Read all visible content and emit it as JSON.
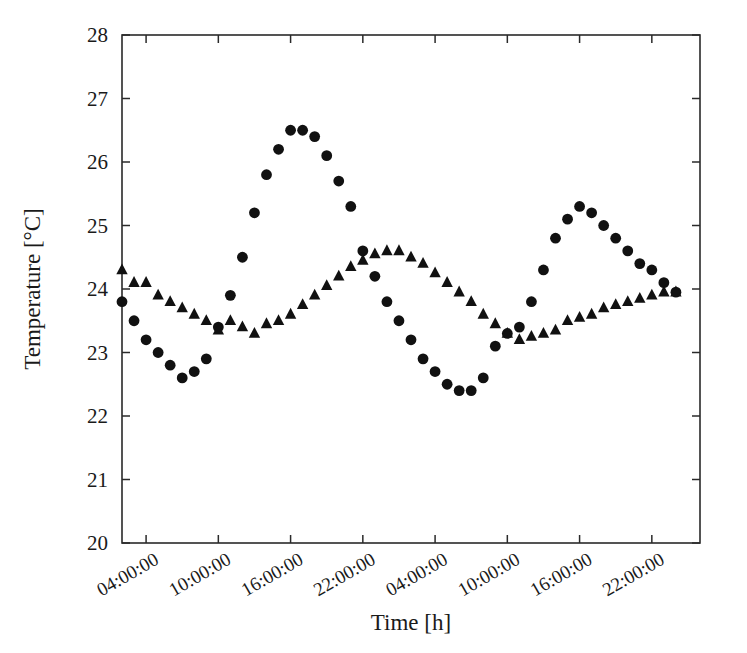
{
  "figure": {
    "background_color": "#ffffff",
    "marker_color": "#111111",
    "axis_color": "#2a2a2a"
  },
  "chart_data": {
    "type": "scatter",
    "title": "",
    "subtitle": "",
    "xlabel": "Time [h]",
    "ylabel": "Temperature [°C]",
    "ylim": [
      20,
      28
    ],
    "xlim": [
      0,
      48
    ],
    "yticks": [
      20,
      21,
      22,
      23,
      24,
      25,
      26,
      27,
      28
    ],
    "ytick_labels": [
      "20",
      "21",
      "22",
      "23",
      "24",
      "25",
      "26",
      "27",
      "28"
    ],
    "xticks": [
      2,
      8,
      14,
      20,
      26,
      32,
      38,
      44
    ],
    "xtick_labels": [
      "04:00:00",
      "10:00:00",
      "16:00:00",
      "22:00:00",
      "04:00:00",
      "10:00:00",
      "16:00:00",
      "22:00:00"
    ],
    "xtick_label_rotation_deg": 30,
    "grid": false,
    "legend": false,
    "legend_position": "none",
    "series": [
      {
        "name": "series-circles",
        "marker": "circle",
        "color": "#111111",
        "x": [
          0,
          1,
          2,
          3,
          4,
          5,
          6,
          7,
          8,
          9,
          10,
          11,
          12,
          13,
          14,
          15,
          16,
          17,
          18,
          19,
          20,
          21,
          22,
          23,
          24,
          25,
          26,
          27,
          28,
          29,
          30,
          31,
          32,
          33,
          34,
          35,
          36,
          37,
          38,
          39,
          40,
          41,
          42,
          43,
          44,
          45,
          46
        ],
        "values": [
          23.8,
          23.5,
          23.2,
          23.0,
          22.8,
          22.6,
          22.7,
          22.9,
          23.4,
          23.9,
          24.5,
          25.2,
          25.8,
          26.2,
          26.5,
          26.5,
          26.4,
          26.1,
          25.7,
          25.3,
          24.6,
          24.2,
          23.8,
          23.5,
          23.2,
          22.9,
          22.7,
          22.5,
          22.4,
          22.4,
          22.6,
          23.1,
          23.3,
          23.4,
          23.8,
          24.3,
          24.8,
          25.1,
          25.3,
          25.2,
          25.0,
          24.8,
          24.6,
          24.4,
          24.3,
          24.1,
          23.95
        ]
      },
      {
        "name": "series-triangles",
        "marker": "triangle",
        "color": "#111111",
        "x": [
          0,
          1,
          2,
          3,
          4,
          5,
          6,
          7,
          8,
          9,
          10,
          11,
          12,
          13,
          14,
          15,
          16,
          17,
          18,
          19,
          20,
          21,
          22,
          23,
          24,
          25,
          26,
          27,
          28,
          29,
          30,
          31,
          32,
          33,
          34,
          35,
          36,
          37,
          38,
          39,
          40,
          41,
          42,
          43,
          44,
          45,
          46
        ],
        "values": [
          24.3,
          24.1,
          24.1,
          23.9,
          23.8,
          23.7,
          23.6,
          23.5,
          23.35,
          23.5,
          23.4,
          23.3,
          23.45,
          23.5,
          23.6,
          23.75,
          23.9,
          24.05,
          24.2,
          24.35,
          24.45,
          24.55,
          24.6,
          24.6,
          24.5,
          24.4,
          24.25,
          24.1,
          23.95,
          23.8,
          23.6,
          23.45,
          23.3,
          23.2,
          23.25,
          23.3,
          23.35,
          23.5,
          23.55,
          23.6,
          23.7,
          23.75,
          23.8,
          23.85,
          23.9,
          23.95,
          23.95
        ]
      }
    ]
  }
}
